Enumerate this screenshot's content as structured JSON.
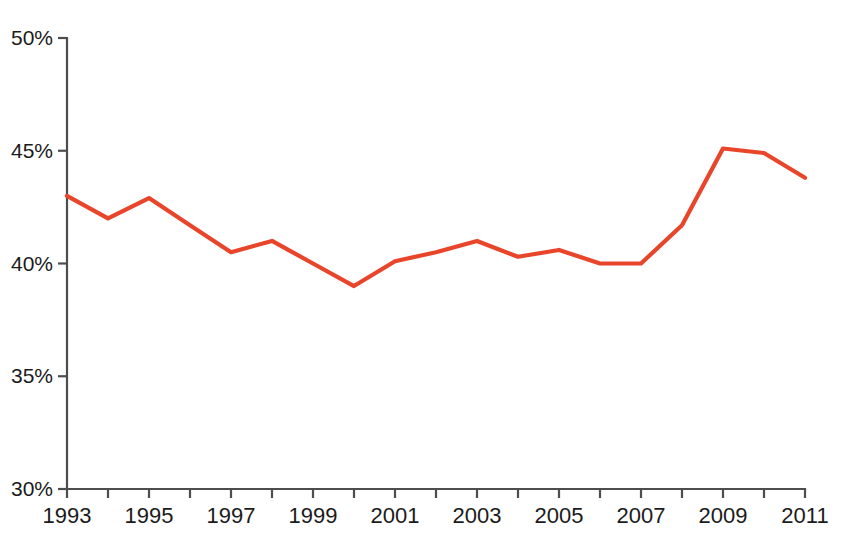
{
  "header": {
    "clipped_caption": ""
  },
  "chart_data": {
    "type": "line",
    "title": "",
    "subtitle": "",
    "xlabel": "",
    "ylabel": "",
    "x": [
      1993,
      1994,
      1995,
      1996,
      1997,
      1998,
      1999,
      2000,
      2001,
      2002,
      2003,
      2004,
      2005,
      2006,
      2007,
      2008,
      2009,
      2010,
      2011
    ],
    "values": [
      43.0,
      42.0,
      42.9,
      41.7,
      40.5,
      41.0,
      40.0,
      39.0,
      40.1,
      40.5,
      41.0,
      40.3,
      40.6,
      40.0,
      40.0,
      41.7,
      45.1,
      44.9,
      43.8
    ],
    "series": [
      {
        "name": "",
        "color": "#E8452A",
        "values": [
          43.0,
          42.0,
          42.9,
          41.7,
          40.5,
          41.0,
          40.0,
          39.0,
          40.1,
          40.5,
          41.0,
          40.3,
          40.6,
          40.0,
          40.0,
          41.7,
          45.1,
          44.9,
          43.8
        ]
      }
    ],
    "xlim": [
      1993,
      2011
    ],
    "ylim": [
      30,
      50
    ],
    "ytick_values": [
      30,
      35,
      40,
      45,
      50
    ],
    "ytick_labels": [
      "30%",
      "35%",
      "40%",
      "45%",
      "50%"
    ],
    "xtick_values": [
      1993,
      1994,
      1995,
      1996,
      1997,
      1998,
      1999,
      2000,
      2001,
      2002,
      2003,
      2004,
      2005,
      2006,
      2007,
      2008,
      2009,
      2010,
      2011
    ],
    "xtick_labels": [
      "1993",
      "",
      "1995",
      "",
      "1997",
      "",
      "1999",
      "",
      "2001",
      "",
      "2003",
      "",
      "2005",
      "",
      "2007",
      "",
      "2009",
      "",
      "2011"
    ],
    "grid": false,
    "legend": false,
    "legend_position": "none",
    "line_color": "#E8452A",
    "axis_color": "#4D4D4D",
    "background_color": "#FFFFFF",
    "annotations": []
  }
}
